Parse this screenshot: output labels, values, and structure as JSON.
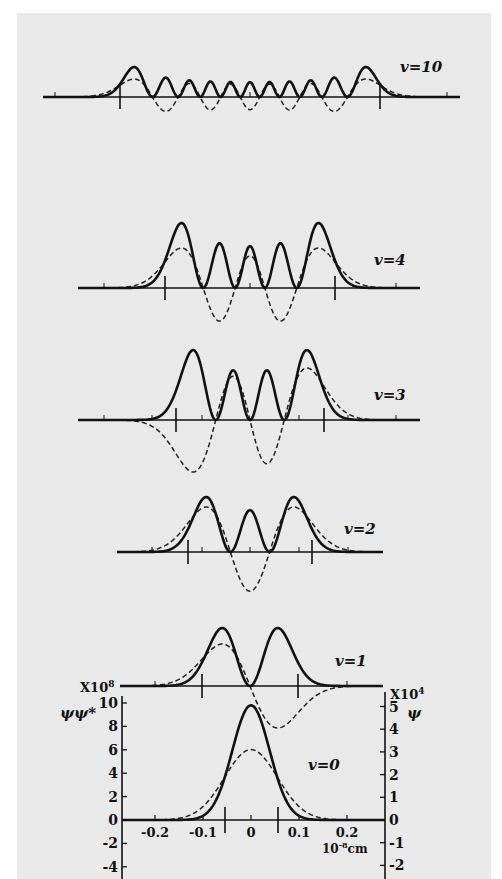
{
  "chart_data": {
    "type": "line",
    "xlabel": "10^-8 cm",
    "left_axis": {
      "label": "ψψ*",
      "multiplier": "X10^8",
      "ticks": [
        10,
        8,
        6,
        4,
        2,
        0,
        -2,
        -4
      ]
    },
    "right_axis": {
      "label": "ψ",
      "multiplier": "X10^4",
      "ticks": [
        5,
        4,
        3,
        2,
        1,
        0,
        -1,
        -2
      ]
    },
    "x_ticks": [
      -0.2,
      -0.1,
      0,
      0.1,
      0.2
    ],
    "xlim": [
      -0.27,
      0.27
    ],
    "legend": {
      "solid": "ψψ* (probability density)",
      "dashed": "ψ (wavefunction)"
    },
    "panels": [
      {
        "label": "v=10",
        "v": 10,
        "classical_turning_points": [
          -0.27,
          0.27
        ]
      },
      {
        "label": "v=4",
        "v": 4,
        "classical_turning_points": [
          -0.18,
          0.18
        ]
      },
      {
        "label": "v=3",
        "v": 3,
        "classical_turning_points": [
          -0.16,
          0.16
        ]
      },
      {
        "label": "v=2",
        "v": 2,
        "classical_turning_points": [
          -0.13,
          0.13
        ]
      },
      {
        "label": "v=1",
        "v": 1,
        "classical_turning_points": [
          -0.1,
          0.1
        ]
      },
      {
        "label": "v=0",
        "v": 0,
        "classical_turning_points": [
          -0.055,
          0.055
        ],
        "psi_peak": 3.1,
        "psipsi_peak": 9.8
      }
    ]
  },
  "labels": {
    "v10": "v=10",
    "v4": "v=4",
    "v3": "v=3",
    "v2": "v=2",
    "v1": "v=1",
    "v0": "v=0",
    "left_mult_base": "X10",
    "left_mult_exp": "8",
    "right_mult_base": "X10",
    "right_mult_exp": "4",
    "left_axis_title": "ψψ*",
    "right_axis_title": "ψ",
    "x_unit_base": "10",
    "x_unit_exp": "-8",
    "x_unit_suffix": "cm",
    "left_ticks": [
      "10",
      "8",
      "6",
      "4",
      "2",
      "0",
      "-2",
      "-4"
    ],
    "right_ticks": [
      "5",
      "4",
      "3",
      "2",
      "1",
      "0",
      "-1",
      "-2"
    ],
    "x_ticks": [
      "-0.2",
      "-0.1",
      "0",
      "0.1",
      "0.2"
    ]
  }
}
